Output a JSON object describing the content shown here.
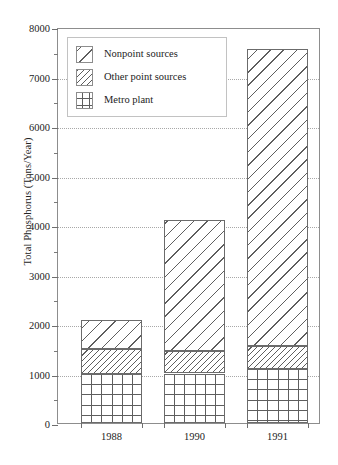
{
  "chart_data": {
    "type": "bar",
    "title": "",
    "xlabel": "",
    "ylabel": "Total Phosphorus (Tons/Year)",
    "categories": [
      "1988",
      "1990",
      "1991"
    ],
    "ylim": [
      0,
      8000
    ],
    "ytick_labels": [
      "0",
      "1000",
      "2000",
      "3000",
      "4000",
      "5000",
      "6000",
      "7000",
      "8000"
    ],
    "ytick_values": [
      0,
      1000,
      2000,
      3000,
      4000,
      5000,
      6000,
      7000,
      8000
    ],
    "yminor_values": [
      500,
      1500,
      2500,
      3500,
      4500,
      5500,
      6500,
      7500
    ],
    "grid": true,
    "grid_style": "dotted",
    "stacked": true,
    "stack_order_bottom_to_top": [
      "Metro plant",
      "Other point sources",
      "Nonpoint sources"
    ],
    "legend_position": "upper left",
    "series": [
      {
        "name": "Metro plant",
        "pattern": "crosshatch",
        "values": [
          1000,
          1000,
          1100
        ]
      },
      {
        "name": "Other point sources",
        "pattern": "dense-diagonal",
        "values": [
          500,
          450,
          450
        ]
      },
      {
        "name": "Nonpoint sources",
        "pattern": "wide-diagonal",
        "values": [
          580,
          2650,
          6000
        ]
      }
    ],
    "totals": [
      2080,
      4100,
      7550
    ],
    "cumulative_tops": [
      {
        "category": "1988",
        "metro_top": 1000,
        "otherpoint_top": 1500,
        "nonpoint_top": 2080
      },
      {
        "category": "1990",
        "metro_top": 1000,
        "otherpoint_top": 1450,
        "nonpoint_top": 4100
      },
      {
        "category": "1991",
        "metro_top": 1100,
        "otherpoint_top": 1550,
        "nonpoint_top": 7550
      }
    ],
    "colors": {
      "hatch": "#5e5e5e",
      "bar_fill": "#ffffff",
      "bar_edge": "#6b6b6b",
      "axis": "#8d8d8d",
      "grid": "#a8a8a8",
      "text": "#232323"
    }
  },
  "legend": {
    "items": [
      {
        "label": "Nonpoint sources"
      },
      {
        "label": "Other point sources"
      },
      {
        "label": "Metro plant"
      }
    ]
  }
}
